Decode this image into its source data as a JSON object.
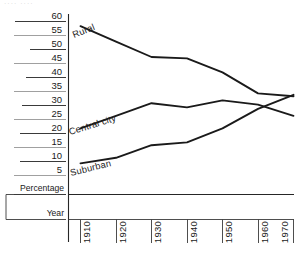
{
  "figure": {
    "top_artifact_text": "····  ····",
    "axis_corner_labels": {
      "percentage": "Percentage",
      "year": "Year"
    }
  },
  "chart_data": {
    "type": "line",
    "title": "",
    "subtitle": "",
    "xlabel": "Year",
    "ylabel": "Percentage",
    "x": [
      1910,
      1920,
      1930,
      1940,
      1950,
      1960,
      1970
    ],
    "categories": [
      "1910",
      "1920",
      "1930",
      "1940",
      "1950",
      "1960",
      "1970"
    ],
    "xlim": [
      1910,
      1970
    ],
    "ylim": [
      0,
      61
    ],
    "yticks": [
      5,
      10,
      15,
      20,
      25,
      30,
      35,
      40,
      45,
      50,
      55,
      60
    ],
    "ytick_labels": [
      "5",
      "10",
      "15",
      "20",
      "25",
      "30",
      "35",
      "40",
      "45",
      "50",
      "55",
      "60"
    ],
    "grid": false,
    "legend_position": "inline-labels",
    "series": [
      {
        "name": "Rural",
        "label": "Rural",
        "values": [
          58.5,
          53.0,
          47.5,
          47.0,
          42.0,
          34.5,
          33.5
        ]
      },
      {
        "name": "Central city",
        "label": "Central city",
        "values": [
          22.0,
          26.5,
          31.0,
          29.5,
          32.0,
          30.5,
          26.5
        ]
      },
      {
        "name": "Suburban",
        "label": "Suburban",
        "values": [
          9.5,
          11.5,
          16.0,
          17.0,
          22.0,
          29.0,
          34.0
        ]
      }
    ],
    "annotations": [
      {
        "text": "Rural",
        "near_series": "Rural",
        "x": 1911,
        "y": 60
      },
      {
        "text": "Central city",
        "near_series": "Central city",
        "x": 1911,
        "y": 26
      },
      {
        "text": "Suburban",
        "near_series": "Suburban",
        "x": 1911,
        "y": 13
      }
    ]
  }
}
